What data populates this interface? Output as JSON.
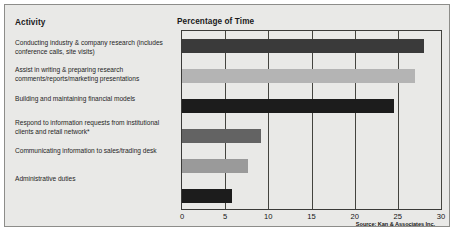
{
  "panel": {
    "activity_header": "Activity",
    "chart_header": "Percentage of Time",
    "source": "Source: Kan & Associates Inc."
  },
  "activities": [
    {
      "label": "Conducting industry & company research (includes conference calls, site visits)"
    },
    {
      "label": "Assist in writing & preparing research comments/reports/marketing presentations"
    },
    {
      "label": "Building and maintaining financial models"
    },
    {
      "label": "Respond to information requests from institutional clients and retail network*"
    },
    {
      "label": "Communicating information to sales/trading desk"
    },
    {
      "label": "Administrative duties"
    }
  ],
  "chart_data": {
    "type": "bar",
    "orientation": "horizontal",
    "title": "Percentage of Time",
    "xlabel": "",
    "ylabel": "Activity",
    "xlim": [
      0,
      30
    ],
    "xticks": [
      0,
      5,
      10,
      15,
      20,
      25,
      30
    ],
    "xtick_labels": [
      "0",
      "5",
      "10",
      "15",
      "20",
      "25",
      "30"
    ],
    "grid": true,
    "legend": "none",
    "categories": [
      "Conducting industry & company research (includes conference calls, site visits)",
      "Assist in writing & preparing research comments/reports/marketing presentations",
      "Building and maintaining financial models",
      "Respond to information requests from institutional clients and retail network*",
      "Communicating information to sales/trading desk",
      "Administrative duties"
    ],
    "values": [
      28,
      27,
      24.5,
      9.2,
      7.7,
      5.8
    ],
    "bar_colors": [
      "#3a3a3a",
      "#b4b4b4",
      "#1c1c1c",
      "#636363",
      "#9a9a9a",
      "#1c1c1c"
    ],
    "annotation": "Source: Kan & Associates Inc."
  },
  "colors": {
    "panel_background": "#e9e9e7",
    "panel_border": "#8d8d8a",
    "axis": "#3a3a38",
    "text": "#1a1a1a"
  }
}
